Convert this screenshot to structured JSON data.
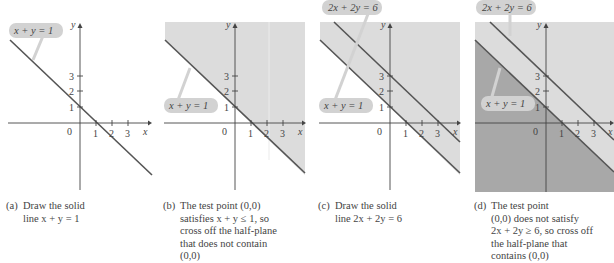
{
  "colors": {
    "light_shade": "#dcdcdc",
    "dark_shade": "#a8a8a8",
    "line": "#555555",
    "axis": "#444444",
    "label_bg": "#d2d2d2"
  },
  "panels": [
    {
      "id": "a",
      "tag": "(a)",
      "caption": [
        "Draw the solid",
        "line x + y = 1"
      ],
      "labels": [
        "x + y = 1"
      ]
    },
    {
      "id": "b",
      "tag": "(b)",
      "caption": [
        "The test point (0,0)",
        "satisfies x + y ≤ 1, so",
        "cross off the half-plane",
        "that does not contain",
        "(0,0)"
      ],
      "labels": [
        "x + y = 1"
      ]
    },
    {
      "id": "c",
      "tag": "(c)",
      "caption": [
        "Draw the solid",
        "line 2x + 2y = 6"
      ],
      "labels": [
        "2x + 2y = 6",
        "x + y = 1"
      ]
    },
    {
      "id": "d",
      "tag": "(d)",
      "caption": [
        "The test point",
        "(0,0) does not satisfy",
        "2x + 2y ≥ 6, so cross off",
        "the half-plane that",
        "contains (0,0)"
      ],
      "labels": [
        "2x + 2y = 6",
        "x + y = 1"
      ]
    }
  ],
  "axes": {
    "x_label": "x",
    "y_label": "y",
    "origin": "0",
    "x_ticks": [
      "1",
      "2",
      "3"
    ],
    "y_ticks": [
      "1",
      "2",
      "3"
    ]
  }
}
